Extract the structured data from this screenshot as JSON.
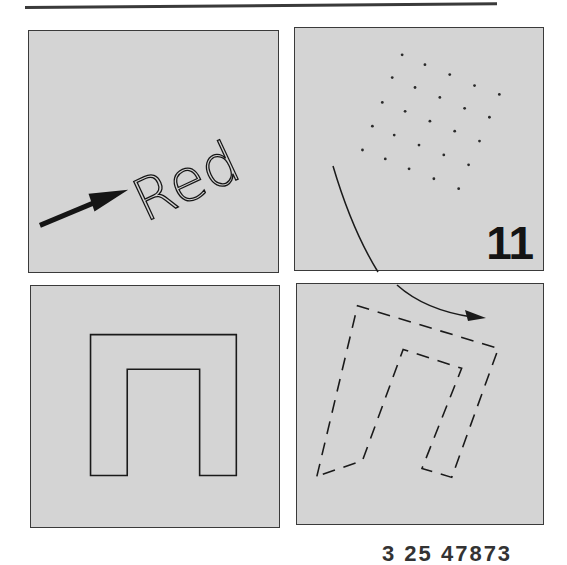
{
  "figure": {
    "panels": {
      "top_left": {
        "label_text": "Red",
        "label_rotation_deg": -25,
        "arrow": "solid-arrow-pointing-to-label"
      },
      "top_right": {
        "step_number": "11",
        "dot_grid": {
          "rows": 5,
          "cols": 5,
          "rotation_deg": 23
        },
        "curved_arrow": "rotation-arc"
      },
      "bottom_left": {
        "shape": "solid-outline-arch"
      },
      "bottom_right": {
        "shape": "dashed-outline-arch-rotated",
        "rotation_deg": 20
      }
    },
    "footer_text": "3 25 47873"
  },
  "colors": {
    "panel_background": "#d4d4d4",
    "stroke": "#1a1a1a",
    "page_background": "#ffffff"
  }
}
